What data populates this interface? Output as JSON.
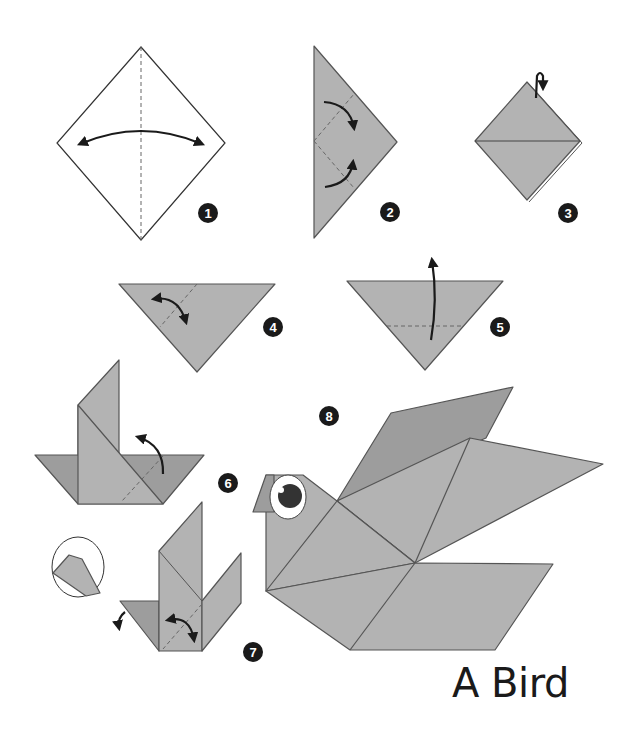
{
  "title": "A Bird",
  "colors": {
    "paper": "#b3b3b3",
    "paper_dark": "#9d9d9d",
    "outline": "#555555",
    "badge": "#1a1a1a",
    "eye_pupil": "#333333"
  },
  "steps": [
    {
      "number": "1",
      "description": "White square diamond with vertical crease and two-way arrow"
    },
    {
      "number": "2",
      "description": "Triangle with two dashed folds and curved arrows"
    },
    {
      "number": "3",
      "description": "Folded diamond with flip-over arrow"
    },
    {
      "number": "4",
      "description": "Inverted triangle with diagonal crease and curved arrow"
    },
    {
      "number": "5",
      "description": "Inverted triangle with horizontal fold and upward arrow"
    },
    {
      "number": "6",
      "description": "Boat shape with raised flap and curved arrow"
    },
    {
      "number": "7",
      "description": "Shape with two raised flaps, circular inset detail"
    },
    {
      "number": "8",
      "description": "Finished origami bird with eye"
    }
  ]
}
